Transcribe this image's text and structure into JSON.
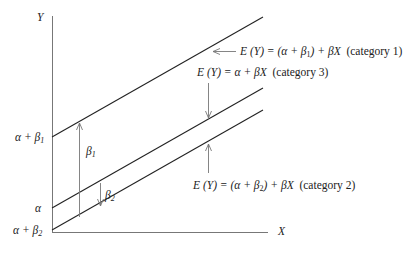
{
  "axes": {
    "y_label": "Y",
    "x_label": "X"
  },
  "y_ticks": [
    {
      "text": "α + β",
      "sub": "1"
    },
    {
      "text": "α",
      "sub": ""
    },
    {
      "text": "α + β",
      "sub": "2"
    }
  ],
  "gaps": {
    "beta1": {
      "text": "β",
      "sub": "1"
    },
    "beta2": {
      "text": "β",
      "sub": "2"
    }
  },
  "lines": [
    {
      "id": "category-1",
      "lhs": "E (Y) = (α + β",
      "sub": "1",
      "rhs": ") + βX",
      "category": "(category 1)"
    },
    {
      "id": "category-3",
      "lhs": "E (Y) = α + βX",
      "sub": "",
      "rhs": "",
      "category": "(category 3)"
    },
    {
      "id": "category-2",
      "lhs": "E (Y) = (α + β",
      "sub": "2",
      "rhs": ") + βX",
      "category": "(category 2)"
    }
  ],
  "colors": {
    "line": "#222222",
    "arrow": "#777777"
  }
}
